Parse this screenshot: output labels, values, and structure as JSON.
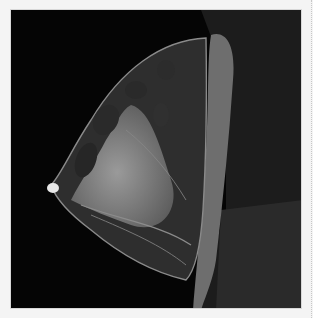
{
  "image": {
    "description": "Sagittal breast MRI scan, dark background, grayscale",
    "colors": {
      "background": "#050505",
      "page": "#f4f4f4",
      "tissue_gray": "#5a5a5a",
      "muscle_gray": "#7a7a7a",
      "bright": "#e8e8e8"
    }
  }
}
